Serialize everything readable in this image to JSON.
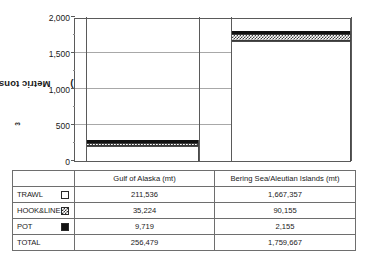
{
  "chart_data": {
    "type": "bar",
    "stacked": true,
    "title": "",
    "xlabel": "",
    "ylabel": "Metric tons (mt 10",
    "ylabel_sup": "3",
    "ylabel_suffix": ")",
    "categories": [
      "Gulf of Alaska (mt)",
      "Bering Sea/Aleutian Islands (mt)"
    ],
    "ylim": [
      0,
      2000
    ],
    "ytick_labels": [
      "0",
      "500",
      "1,000",
      "1,500",
      "2,000"
    ],
    "ytick_values": [
      0,
      500,
      1000,
      1500,
      2000
    ],
    "minor_tick_values": [
      250,
      750,
      1250,
      1750
    ],
    "grid": true,
    "legend_position": "table-below",
    "units_note": "values in table are metric tons; bars plotted in mt 10^3",
    "series": [
      {
        "name": "TRAWL",
        "swatch": "open-square",
        "values": [
          211536,
          1667357
        ],
        "plot_values": [
          211.536,
          1667.357
        ]
      },
      {
        "name": "HOOK&LINE",
        "swatch": "checkered-square",
        "values": [
          35224,
          90155
        ],
        "plot_values": [
          35.224,
          90.155
        ]
      },
      {
        "name": "POT",
        "swatch": "solid-square",
        "values": [
          9719,
          2155
        ],
        "plot_values": [
          9.719,
          2.155
        ]
      }
    ],
    "totals": {
      "label": "TOTAL",
      "values": [
        256479,
        1759667
      ],
      "display": [
        "256,479",
        "1,759,667"
      ]
    }
  },
  "table": {
    "header": [
      "",
      "Gulf of Alaska (mt)",
      "Bering Sea/Aleutian Islands (mt)"
    ],
    "rows": [
      {
        "label": "TRAWL",
        "swatch": "open-square",
        "goa": "211,536",
        "bsai": "1,667,357"
      },
      {
        "label": "HOOK&LINE",
        "swatch": "checkered-square",
        "goa": "35,224",
        "bsai": "90,155"
      },
      {
        "label": "POT",
        "swatch": "solid-square",
        "goa": "9,719",
        "bsai": "2,155"
      },
      {
        "label": "TOTAL",
        "swatch": "none",
        "goa": "256,479",
        "bsai": "1,759,667"
      }
    ]
  }
}
